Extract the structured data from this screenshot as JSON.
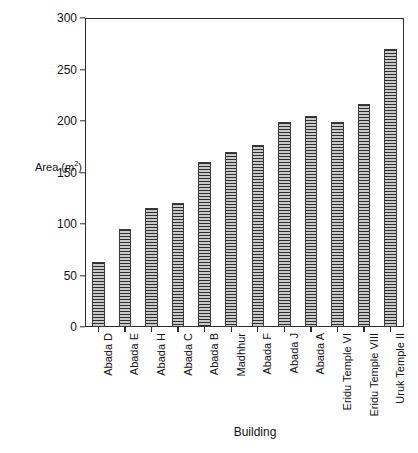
{
  "chart_data": {
    "type": "bar",
    "title": "",
    "xlabel": "Building",
    "ylabel": "Area (m2)",
    "ylabel_text": "Area (m",
    "ylabel_sup": "2",
    "ylabel_tail": ")",
    "categories": [
      "Abada D",
      "Abada E",
      "Abada H",
      "Abada C",
      "Abada B",
      "Madhhur",
      "Abada F",
      "Abada J",
      "Abada A",
      "Eridu Temple VI",
      "Eridu Temple VIII",
      "Uruk Temple II"
    ],
    "values": [
      63,
      95,
      116,
      120,
      160,
      170,
      177,
      199,
      205,
      199,
      217,
      270
    ],
    "ylim": [
      0,
      300
    ],
    "yticks": [
      0,
      50,
      100,
      150,
      200,
      250,
      300
    ],
    "ytick_labels": [
      "0",
      "50",
      "100",
      "150",
      "200",
      "250",
      "300"
    ],
    "grid": false,
    "legend": false,
    "bar_fill": "#9e9e9e",
    "bar_hatch": "horizontal-lines",
    "bar_edge_color": "#3a3a3a",
    "axis_color": "#2b2b2b",
    "background": "#ffffff"
  }
}
